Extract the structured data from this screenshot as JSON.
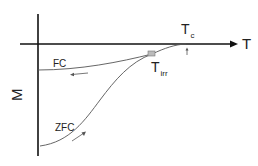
{
  "diagram": {
    "type": "magnetization-vs-temperature schematic",
    "axes": {
      "x_label": "T",
      "y_label": "M"
    },
    "curves": [
      {
        "name": "FC",
        "label": "FC",
        "direction": "cooling (arrow pointing left)"
      },
      {
        "name": "ZFC",
        "label": "ZFC",
        "direction": "warming (arrow pointing right/up)"
      }
    ],
    "markers": {
      "t_c": {
        "main": "T",
        "sub": "c"
      },
      "t_irr": {
        "main": "T",
        "sub": "irr"
      }
    },
    "colors": {
      "axis": "#111111",
      "curve": "#555555",
      "marker_fill": "#bbbbbb"
    }
  }
}
